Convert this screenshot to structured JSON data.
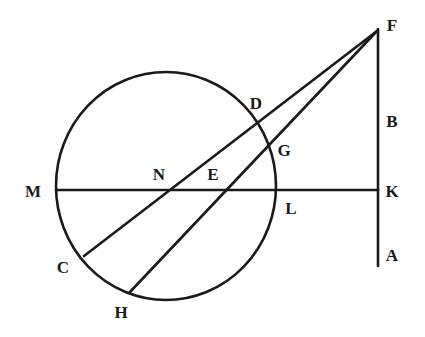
{
  "figure": {
    "type": "euclidean-geometry-diagram",
    "background_color": "#ffffff",
    "stroke_color": "#1a1a1a",
    "stroke_width": 2.6,
    "canvas": {
      "width": 425,
      "height": 337
    }
  },
  "circle": {
    "name": "main-circle",
    "center": {
      "x": 166,
      "y": 186
    },
    "radius_x": 110,
    "radius_y": 114
  },
  "segments": [
    {
      "name": "line-mk-horizontal",
      "from": {
        "x": 56,
        "y": 190
      },
      "to": {
        "x": 378,
        "y": 190
      },
      "endpoints": [
        "M",
        "K"
      ]
    },
    {
      "name": "line-fa-vertical",
      "from": {
        "x": 378,
        "y": 29
      },
      "to": {
        "x": 378,
        "y": 266
      },
      "endpoints": [
        "F",
        "A"
      ]
    },
    {
      "name": "line-cf-secant",
      "from": {
        "x": 84,
        "y": 256
      },
      "to": {
        "x": 377,
        "y": 31
      },
      "endpoints": [
        "C",
        "F"
      ]
    },
    {
      "name": "line-hf-secant",
      "from": {
        "x": 129,
        "y": 293
      },
      "to": {
        "x": 377,
        "y": 31
      },
      "endpoints": [
        "H",
        "F"
      ]
    }
  ],
  "points": [
    {
      "id": "F",
      "label": "F",
      "label_x": 392,
      "label_y": 25,
      "mark_x": 377,
      "mark_y": 30
    },
    {
      "id": "D",
      "label": "D",
      "label_x": 256,
      "label_y": 103,
      "mark_x": 248,
      "mark_y": 121
    },
    {
      "id": "B",
      "label": "B",
      "label_x": 392,
      "label_y": 121,
      "mark_x": 378,
      "mark_y": 121
    },
    {
      "id": "G",
      "label": "G",
      "label_x": 284,
      "label_y": 150,
      "mark_x": 268,
      "mark_y": 146
    },
    {
      "id": "N",
      "label": "N",
      "label_x": 159,
      "label_y": 174,
      "mark_x": 174,
      "mark_y": 190
    },
    {
      "id": "E",
      "label": "E",
      "label_x": 213,
      "label_y": 174,
      "mark_x": 227,
      "mark_y": 190
    },
    {
      "id": "M",
      "label": "M",
      "label_x": 33,
      "label_y": 191,
      "mark_x": 56,
      "mark_y": 190
    },
    {
      "id": "K",
      "label": "K",
      "label_x": 392,
      "label_y": 191,
      "mark_x": 378,
      "mark_y": 190
    },
    {
      "id": "L",
      "label": "L",
      "label_x": 291,
      "label_y": 208,
      "mark_x": 275,
      "mark_y": 192
    },
    {
      "id": "A",
      "label": "A",
      "label_x": 392,
      "label_y": 255,
      "mark_x": 378,
      "mark_y": 255
    },
    {
      "id": "C",
      "label": "C",
      "label_x": 63,
      "label_y": 267,
      "mark_x": 84,
      "mark_y": 256
    },
    {
      "id": "H",
      "label": "H",
      "label_x": 121,
      "label_y": 312,
      "mark_x": 129,
      "mark_y": 293
    }
  ],
  "chart_data": {
    "type": "diagram",
    "elements": {
      "circle_center": [
        166,
        186
      ],
      "circle_radius": 112,
      "vertices": {
        "F": [
          377,
          30
        ],
        "A": [
          378,
          266
        ],
        "B": [
          378,
          121
        ],
        "K": [
          378,
          190
        ],
        "M": [
          56,
          190
        ],
        "C": [
          84,
          256
        ],
        "H": [
          129,
          293
        ],
        "D": [
          248,
          121
        ],
        "G": [
          268,
          146
        ],
        "N": [
          174,
          190
        ],
        "E": [
          227,
          190
        ],
        "L": [
          275,
          192
        ]
      },
      "lines": [
        [
          "M",
          "K"
        ],
        [
          "F",
          "A"
        ],
        [
          "C",
          "F"
        ],
        [
          "H",
          "F"
        ]
      ]
    }
  }
}
